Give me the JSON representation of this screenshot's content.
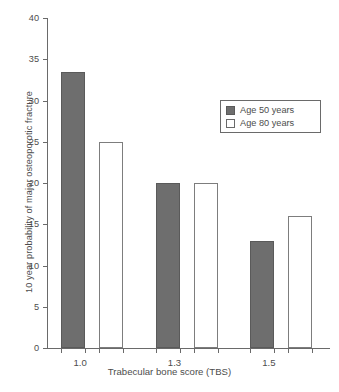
{
  "chart_data": {
    "type": "bar",
    "title": "",
    "xlabel": "Trabecular bone score (TBS)",
    "ylabel": "10 year probability of major osteoporotic fracture",
    "categories": [
      "1.0",
      "1.3",
      "1.5"
    ],
    "series": [
      {
        "name": "Age 50 years",
        "values": [
          33.4,
          20,
          13
        ],
        "color": "#6e6e6e",
        "fill": "solid"
      },
      {
        "name": "Age 80 years",
        "values": [
          25,
          20,
          16
        ],
        "color": "#ffffff",
        "fill": "open"
      }
    ],
    "ylim": [
      0,
      40
    ],
    "ytick_labels": [
      "0",
      "5",
      "10",
      "15",
      "20",
      "25",
      "30",
      "35",
      "40"
    ],
    "ytick_values": [
      0,
      5,
      10,
      15,
      20,
      25,
      30,
      35,
      40
    ],
    "xtick_labels": [
      "1.0",
      "1.3",
      "1.5"
    ],
    "grid": false,
    "legend_position": "upper right",
    "legend_entries": [
      "Age 50 years",
      "Age 80 years"
    ]
  },
  "axes": {
    "y_title": "10 year probability of major osteoporotic fracture",
    "x_title": "Trabecular bone score (TBS)"
  },
  "legend": {
    "items": [
      {
        "label": "Age 50 years"
      },
      {
        "label": "Age 80 years"
      }
    ]
  }
}
